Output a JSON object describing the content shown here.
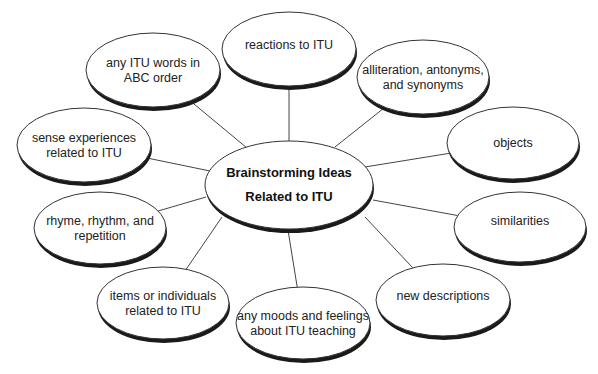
{
  "diagram": {
    "type": "mind-map",
    "center": {
      "lines": [
        "Brainstorming Ideas",
        "Related to ITU"
      ],
      "cx": 289,
      "cy": 185,
      "rx": 84,
      "ry": 44
    },
    "nodes": [
      {
        "id": "reactions",
        "lines": [
          "reactions to ITU"
        ],
        "cx": 289,
        "cy": 49,
        "rx": 67,
        "ry": 37,
        "text_dy": -4,
        "anchor": [
          289,
          142
        ]
      },
      {
        "id": "abc-order",
        "lines": [
          "any ITU words in",
          "ABC order"
        ],
        "cx": 153,
        "cy": 70,
        "rx": 67,
        "ry": 37,
        "text_dy": 0,
        "anchor": [
          247,
          148
        ]
      },
      {
        "id": "alliteration",
        "lines": [
          "alliteration, antonyms,",
          "and synonyms"
        ],
        "cx": 423,
        "cy": 77,
        "rx": 66,
        "ry": 37,
        "text_dy": 0,
        "anchor": [
          335,
          147
        ]
      },
      {
        "id": "sense",
        "lines": [
          "sense experiences",
          "related to ITU"
        ],
        "cx": 84,
        "cy": 145,
        "rx": 67,
        "ry": 37,
        "text_dy": 0,
        "anchor": [
          210,
          171
        ]
      },
      {
        "id": "objects",
        "lines": [
          "objects"
        ],
        "cx": 513,
        "cy": 143,
        "rx": 66,
        "ry": 36,
        "text_dy": 0,
        "anchor": [
          365,
          167
        ]
      },
      {
        "id": "rhyme",
        "lines": [
          "rhyme, rhythm, and",
          "repetition"
        ],
        "cx": 100,
        "cy": 228,
        "rx": 66,
        "ry": 36,
        "text_dy": 0,
        "anchor": [
          206,
          197
        ]
      },
      {
        "id": "similarities",
        "lines": [
          "similarities"
        ],
        "cx": 520,
        "cy": 227,
        "rx": 66,
        "ry": 35,
        "text_dy": -6,
        "anchor": [
          373,
          200
        ]
      },
      {
        "id": "items",
        "lines": [
          "items or individuals",
          "related to ITU"
        ],
        "cx": 163,
        "cy": 303,
        "rx": 66,
        "ry": 36,
        "text_dy": 0,
        "anchor": [
          222,
          217
        ]
      },
      {
        "id": "new-descriptions",
        "lines": [
          "new descriptions"
        ],
        "cx": 443,
        "cy": 300,
        "rx": 67,
        "ry": 36,
        "text_dy": -4,
        "anchor": [
          365,
          217
        ]
      },
      {
        "id": "moods",
        "lines": [
          "any moods and feelings",
          "about ITU teaching"
        ],
        "cx": 303,
        "cy": 323,
        "rx": 67,
        "ry": 36,
        "text_dy": 0,
        "anchor": [
          288,
          230
        ]
      }
    ],
    "colors": {
      "background": "#ffffff",
      "outline": "#333333",
      "shadow": "#1a1a1a",
      "connector": "#444444",
      "text": "#222222"
    }
  }
}
